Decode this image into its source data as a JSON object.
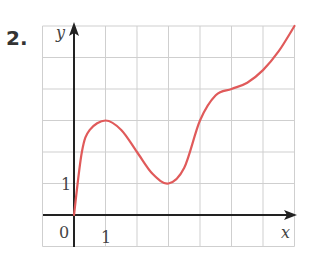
{
  "problem_number": "2.",
  "chart_data": {
    "type": "line",
    "title": "",
    "xlabel": "x",
    "ylabel": "y",
    "tick_labels": {
      "origin": "0",
      "x": [
        "1"
      ],
      "y": [
        "1"
      ]
    },
    "xlim": [
      -1,
      7
    ],
    "ylim": [
      -1,
      6
    ],
    "grid": true,
    "legend": null,
    "series": [
      {
        "name": "f(x)",
        "color": "#e05a5a",
        "x": [
          0,
          0.25,
          0.5,
          1,
          1.5,
          2,
          2.5,
          3,
          3.5,
          4,
          4.5,
          5,
          5.5,
          6,
          6.5,
          7
        ],
        "y": [
          0,
          2,
          2.7,
          3,
          2.7,
          2.0,
          1.3,
          1,
          1.5,
          3,
          3.8,
          4,
          4.2,
          4.6,
          5.2,
          6
        ]
      }
    ]
  },
  "colors": {
    "curve": "#e05a5a",
    "grid": "#cfcfcf",
    "axis": "#222222"
  }
}
